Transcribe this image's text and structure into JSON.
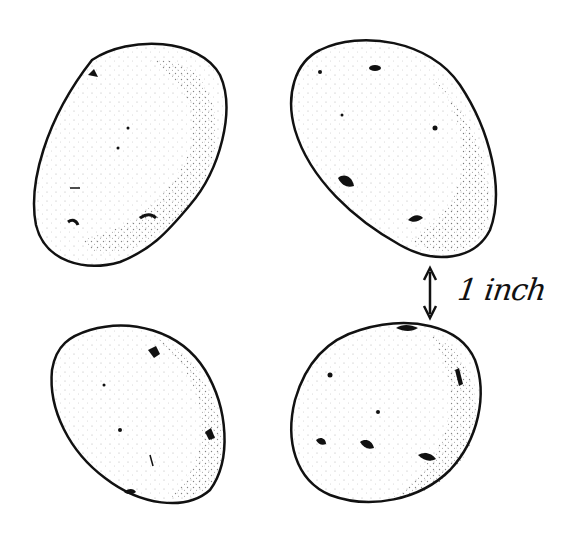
{
  "figure": {
    "annotation": {
      "label": "1 inch",
      "icon": "double-headed-vertical-arrow"
    },
    "items": [
      {
        "name": "potato-top-left"
      },
      {
        "name": "potato-top-right"
      },
      {
        "name": "potato-bottom-left"
      },
      {
        "name": "potato-bottom-right"
      }
    ],
    "colors": {
      "ink": "#111111",
      "background": "#ffffff"
    }
  }
}
